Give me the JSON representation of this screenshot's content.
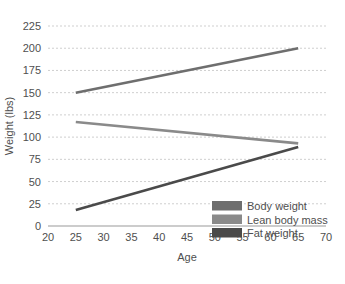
{
  "chart_data": {
    "type": "line",
    "title": "",
    "xlabel": "Age",
    "ylabel": "Weight (lbs)",
    "xlim": [
      20,
      70
    ],
    "ylim": [
      0,
      225
    ],
    "x_ticks": [
      20,
      25,
      30,
      35,
      40,
      45,
      50,
      55,
      60,
      65,
      70
    ],
    "y_ticks": [
      0,
      25,
      50,
      75,
      100,
      125,
      150,
      175,
      200,
      225
    ],
    "grid": true,
    "legend_position": "bottom-right",
    "series": [
      {
        "name": "Body weight",
        "color": "#6e6e6e",
        "x": [
          25,
          65
        ],
        "values": [
          150,
          200
        ]
      },
      {
        "name": "Lean body mass",
        "color": "#8a8a8a",
        "x": [
          25,
          65
        ],
        "values": [
          117,
          93
        ]
      },
      {
        "name": "Fat weight",
        "color": "#4a4a4a",
        "x": [
          25,
          65
        ],
        "values": [
          18,
          89
        ]
      }
    ]
  },
  "axes": {
    "x_tick_labels": [
      "20",
      "25",
      "30",
      "35",
      "40",
      "45",
      "50",
      "55",
      "60",
      "65",
      "70"
    ],
    "y_tick_labels": [
      "0",
      "25",
      "50",
      "75",
      "100",
      "125",
      "150",
      "175",
      "200",
      "225"
    ],
    "x_axis_title": "Age",
    "y_axis_title": "Weight (lbs)"
  },
  "legend": {
    "entries": [
      {
        "label": "Body weight",
        "color": "#6e6e6e"
      },
      {
        "label": "Lean body mass",
        "color": "#8a8a8a"
      },
      {
        "label": "Fat weight",
        "color": "#4a4a4a"
      }
    ]
  },
  "colors": {
    "background": "#ffffff",
    "gridline": "#cfcfcf",
    "baseline": "#9a9a9a",
    "text": "#4f4f4f"
  }
}
